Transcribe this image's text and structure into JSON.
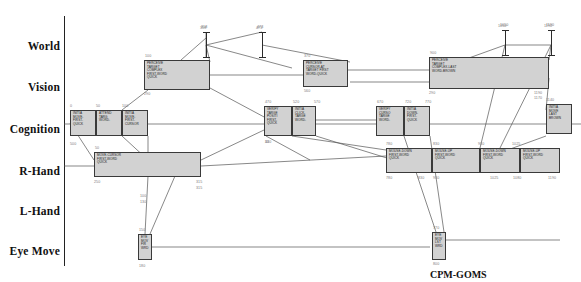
{
  "figure": {
    "caption": "CPM-GOMS",
    "box_fill": "#d2d2d2",
    "box_border": "#3a3a3a",
    "link_color": "#555555",
    "label_color": "#7a7a7a"
  },
  "axis": {
    "rows": [
      {
        "id": "world",
        "label": "World",
        "y": 47
      },
      {
        "id": "vision",
        "label": "Vision",
        "y": 88
      },
      {
        "id": "cognition",
        "label": "Cognition",
        "y": 130
      },
      {
        "id": "rhand",
        "label": "R-Hand",
        "y": 172
      },
      {
        "id": "lhand",
        "label": "L-Hand",
        "y": 212
      },
      {
        "id": "eyemove",
        "label": "Eye Move",
        "y": 252
      }
    ]
  },
  "world_markers": [
    {
      "label": "318",
      "x": 203,
      "y": 32
    },
    {
      "label": "473",
      "x": 259,
      "y": 32
    },
    {
      "label": "1050",
      "x": 502,
      "y": 30
    },
    {
      "label": "1190",
      "x": 548,
      "y": 30
    }
  ],
  "boxes": [
    {
      "row": "vision",
      "x": 144,
      "y": 60,
      "w": 66,
      "h": 30,
      "lines": "PERCEIVE\nTARGET\nCOMPLEX\nFIRST-WORD\nQUICK",
      "start": "100",
      "end": "290"
    },
    {
      "row": "vision",
      "x": 303,
      "y": 60,
      "w": 45,
      "h": 27,
      "lines": "PERCEIVE\nCURSOR-AT\nTARGET FIRST\nWORD-QUICK",
      "start": "370",
      "end": "560"
    },
    {
      "row": "vision",
      "x": 429,
      "y": 57,
      "w": 120,
      "h": 32,
      "lines": "PERCEIVE\nTARGET\nCOMPLEX-LAST\nWORD-BROWN",
      "start": "900",
      "end": "1190"
    },
    {
      "row": "cognition",
      "x": 70,
      "y": 110,
      "w": 26,
      "h": 26,
      "lines": "INITIA\nMOVE-\nFIRST-\nQUICK",
      "start": "0",
      "end": "50"
    },
    {
      "row": "cognition",
      "x": 96,
      "y": 110,
      "w": 26,
      "h": 26,
      "lines": "ATTEND\nTARG\nWORD-",
      "start": "50",
      "end": "100"
    },
    {
      "row": "cognition",
      "x": 122,
      "y": 110,
      "w": 26,
      "h": 26,
      "lines": "INITIA\nMOVE-\nFIRST-\nCURSOR",
      "start": "100",
      "end": "150"
    },
    {
      "row": "cognition",
      "x": 264,
      "y": 106,
      "w": 28,
      "h": 30,
      "lines": "VERIFY\nTARGE\nPOSITI\nFIRST-\nQUICK",
      "start": "470",
      "end": "520"
    },
    {
      "row": "cognition",
      "x": 292,
      "y": 106,
      "w": 24,
      "h": 30,
      "lines": "INITIA\nCLICK-\nTARGE\nWORD-",
      "start": "520",
      "end": "570"
    },
    {
      "row": "cognition",
      "x": 376,
      "y": 106,
      "w": 28,
      "h": 30,
      "lines": "VERIFY\nCURSO\nTARGE\nWORD-",
      "start": "670",
      "end": "720"
    },
    {
      "row": "cognition",
      "x": 404,
      "y": 106,
      "w": 26,
      "h": 30,
      "lines": "INITIA\nDOWN-\nFIRST-\nQUICK",
      "start": "720",
      "end": "770"
    },
    {
      "row": "cognition",
      "x": 546,
      "y": 104,
      "w": 26,
      "h": 30,
      "lines": "INITIA\nMOVE\nLAST\nBROWN",
      "start": "1140",
      "end": "1190"
    },
    {
      "row": "rhand",
      "x": 94,
      "y": 152,
      "w": 107,
      "h": 25,
      "lines": "MOVE-CURSOR\nFIRST-WORD\nQUICK",
      "start": "50",
      "end": "315",
      "start2": "250"
    },
    {
      "row": "rhand",
      "x": 386,
      "y": 148,
      "w": 46,
      "h": 25,
      "lines": "MOUSE-DOWN\nFIRST-WORD\nQUICK",
      "start": "780",
      "end": "830"
    },
    {
      "row": "rhand",
      "x": 432,
      "y": 148,
      "w": 48,
      "h": 25,
      "lines": "MOUSE-UP\nFIRST-WORD\nQUICK",
      "start": "830",
      "end": "930"
    },
    {
      "row": "rhand",
      "x": 480,
      "y": 148,
      "w": 40,
      "h": 25,
      "lines": "MOUSE-DOWN\nFIRST-WORD\nQUICK",
      "start": "1025",
      "end": "1075"
    },
    {
      "row": "rhand",
      "x": 520,
      "y": 148,
      "w": 40,
      "h": 25,
      "lines": "MOUSE-UP\nFIRST-WORD\nQUICK",
      "start": "1080",
      "end": "1190"
    },
    {
      "row": "eyemove",
      "x": 138,
      "y": 234,
      "w": 14,
      "h": 26,
      "lines": "EYE\nMOV\nFIR\nWRD",
      "start": "150",
      "end": "180"
    },
    {
      "row": "eyemove",
      "x": 432,
      "y": 232,
      "w": 14,
      "h": 28,
      "lines": "EYE\nMOV\nLST\nWRD",
      "start": "770",
      "end": "800"
    }
  ],
  "tick_labels": [
    {
      "text": "0",
      "x": 70,
      "y": 104
    },
    {
      "text": "50",
      "x": 96,
      "y": 104
    },
    {
      "text": "100",
      "x": 122,
      "y": 104
    },
    {
      "text": "100",
      "x": 145,
      "y": 54
    },
    {
      "text": "290",
      "x": 144,
      "y": 92
    },
    {
      "text": "370",
      "x": 304,
      "y": 54
    },
    {
      "text": "560",
      "x": 304,
      "y": 89
    },
    {
      "text": "900",
      "x": 430,
      "y": 51
    },
    {
      "text": "290",
      "x": 429,
      "y": 91
    },
    {
      "text": "1190",
      "x": 534,
      "y": 91
    },
    {
      "text": "1170",
      "x": 534,
      "y": 96
    },
    {
      "text": "470",
      "x": 265,
      "y": 100
    },
    {
      "text": "520",
      "x": 293,
      "y": 100
    },
    {
      "text": "570",
      "x": 314,
      "y": 100
    },
    {
      "text": "670",
      "x": 377,
      "y": 100
    },
    {
      "text": "720",
      "x": 405,
      "y": 100
    },
    {
      "text": "770",
      "x": 425,
      "y": 100
    },
    {
      "text": "430",
      "x": 265,
      "y": 140
    },
    {
      "text": "50",
      "x": 265,
      "y": 140
    },
    {
      "text": "1140",
      "x": 546,
      "y": 98
    },
    {
      "text": "50",
      "x": 95,
      "y": 146
    },
    {
      "text": "250",
      "x": 94,
      "y": 180
    },
    {
      "text": "315",
      "x": 196,
      "y": 180
    },
    {
      "text": "315",
      "x": 196,
      "y": 186
    },
    {
      "text": "780",
      "x": 386,
      "y": 142
    },
    {
      "text": "830",
      "x": 433,
      "y": 142
    },
    {
      "text": "930",
      "x": 478,
      "y": 142
    },
    {
      "text": "1025",
      "x": 512,
      "y": 142
    },
    {
      "text": "780",
      "x": 386,
      "y": 176
    },
    {
      "text": "830",
      "x": 418,
      "y": 176
    },
    {
      "text": "930",
      "x": 433,
      "y": 176
    },
    {
      "text": "1025",
      "x": 490,
      "y": 176
    },
    {
      "text": "1080",
      "x": 513,
      "y": 176
    },
    {
      "text": "1190",
      "x": 548,
      "y": 176
    },
    {
      "text": "150",
      "x": 139,
      "y": 228
    },
    {
      "text": "180",
      "x": 139,
      "y": 264
    },
    {
      "text": "770",
      "x": 433,
      "y": 226
    },
    {
      "text": "800",
      "x": 433,
      "y": 262
    },
    {
      "text": "100",
      "x": 140,
      "y": 194
    },
    {
      "text": "130",
      "x": 140,
      "y": 200
    },
    {
      "text": "500",
      "x": 70,
      "y": 142
    },
    {
      "text": "1050",
      "x": 498,
      "y": 24
    },
    {
      "text": "1190",
      "x": 544,
      "y": 24
    },
    {
      "text": "318",
      "x": 200,
      "y": 26
    },
    {
      "text": "473",
      "x": 256,
      "y": 26
    }
  ],
  "links": [
    {
      "x1": 70,
      "y1": 123,
      "x2": 94,
      "y2": 160
    },
    {
      "x1": 122,
      "y1": 136,
      "x2": 148,
      "y2": 160
    },
    {
      "x1": 122,
      "y1": 110,
      "x2": 148,
      "y2": 90
    },
    {
      "x1": 148,
      "y1": 136,
      "x2": 148,
      "y2": 152
    },
    {
      "x1": 148,
      "y1": 176,
      "x2": 145,
      "y2": 234
    },
    {
      "x1": 175,
      "y1": 176,
      "x2": 150,
      "y2": 234
    },
    {
      "x1": 152,
      "y1": 247,
      "x2": 430,
      "y2": 247
    },
    {
      "x1": 210,
      "y1": 62,
      "x2": 206,
      "y2": 45
    },
    {
      "x1": 210,
      "y1": 75,
      "x2": 303,
      "y2": 75
    },
    {
      "x1": 210,
      "y1": 88,
      "x2": 266,
      "y2": 118
    },
    {
      "x1": 206,
      "y1": 45,
      "x2": 262,
      "y2": 32
    },
    {
      "x1": 206,
      "y1": 45,
      "x2": 292,
      "y2": 68
    },
    {
      "x1": 262,
      "y1": 45,
      "x2": 350,
      "y2": 62
    },
    {
      "x1": 206,
      "y1": 32,
      "x2": 206,
      "y2": 58
    },
    {
      "x1": 181,
      "y1": 60,
      "x2": 206,
      "y2": 38
    },
    {
      "x1": 122,
      "y1": 124,
      "x2": 264,
      "y2": 124
    },
    {
      "x1": 316,
      "y1": 120,
      "x2": 376,
      "y2": 120
    },
    {
      "x1": 201,
      "y1": 166,
      "x2": 386,
      "y2": 156
    },
    {
      "x1": 201,
      "y1": 160,
      "x2": 264,
      "y2": 130
    },
    {
      "x1": 292,
      "y1": 136,
      "x2": 386,
      "y2": 150
    },
    {
      "x1": 316,
      "y1": 136,
      "x2": 432,
      "y2": 172
    },
    {
      "x1": 348,
      "y1": 70,
      "x2": 429,
      "y2": 70
    },
    {
      "x1": 404,
      "y1": 136,
      "x2": 436,
      "y2": 232
    },
    {
      "x1": 430,
      "y1": 136,
      "x2": 444,
      "y2": 232
    },
    {
      "x1": 446,
      "y1": 240,
      "x2": 560,
      "y2": 240
    },
    {
      "x1": 549,
      "y1": 60,
      "x2": 551,
      "y2": 45
    },
    {
      "x1": 549,
      "y1": 78,
      "x2": 546,
      "y2": 110
    },
    {
      "x1": 505,
      "y1": 45,
      "x2": 551,
      "y2": 45
    },
    {
      "x1": 430,
      "y1": 72,
      "x2": 505,
      "y2": 45
    },
    {
      "x1": 505,
      "y1": 45,
      "x2": 480,
      "y2": 148
    },
    {
      "x1": 551,
      "y1": 45,
      "x2": 500,
      "y2": 148
    },
    {
      "x1": 572,
      "y1": 124,
      "x2": 581,
      "y2": 124
    },
    {
      "x1": 64,
      "y1": 124,
      "x2": 70,
      "y2": 124
    },
    {
      "x1": 64,
      "y1": 166,
      "x2": 94,
      "y2": 166
    },
    {
      "x1": 316,
      "y1": 124,
      "x2": 376,
      "y2": 124
    },
    {
      "x1": 430,
      "y1": 124,
      "x2": 546,
      "y2": 124
    },
    {
      "x1": 480,
      "y1": 160,
      "x2": 546,
      "y2": 136
    },
    {
      "x1": 432,
      "y1": 160,
      "x2": 480,
      "y2": 160
    },
    {
      "x1": 350,
      "y1": 82,
      "x2": 429,
      "y2": 82
    },
    {
      "x1": 266,
      "y1": 136,
      "x2": 310,
      "y2": 160
    }
  ]
}
